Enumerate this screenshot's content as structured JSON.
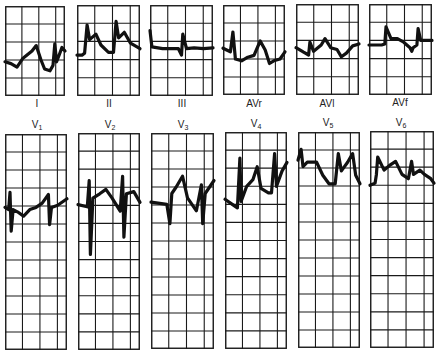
{
  "chart_data": {
    "type": "ecg-12-lead",
    "title": "",
    "layout": {
      "rows": 2,
      "columns": 6,
      "grid": true,
      "top_row_grid": {
        "cols": 4,
        "rows": 5
      },
      "bottom_row_grid": {
        "cols": 4,
        "rows": 12
      }
    },
    "leads": [
      {
        "name": "I",
        "row": 0,
        "col": 0,
        "description": "baseline below center; rounded T waves, small R spikes"
      },
      {
        "name": "II",
        "row": 0,
        "col": 1,
        "description": "tall R spikes followed by elevated ST/T humps"
      },
      {
        "name": "III",
        "row": 0,
        "col": 2,
        "description": "near-flat baseline with small spikes"
      },
      {
        "name": "AVr",
        "row": 0,
        "col": 3,
        "description": "R spikes with deep negative ST segments"
      },
      {
        "name": "AVl",
        "row": 0,
        "col": 4,
        "description": "low amplitude, slight T elevation, negative dips"
      },
      {
        "name": "AVf",
        "row": 0,
        "col": 5,
        "description": "spikes with elevated plateau then return"
      },
      {
        "name": "V1",
        "row": 1,
        "col": 0,
        "description": "rS complexes with deep S waves"
      },
      {
        "name": "V2",
        "row": 1,
        "col": 1,
        "description": "deep S waves, prominent peaked T"
      },
      {
        "name": "V3",
        "row": 1,
        "col": 2,
        "description": "RS complexes, peaked T waves"
      },
      {
        "name": "V4",
        "row": 1,
        "col": 3,
        "description": "tall R, ST elevation with peaked T"
      },
      {
        "name": "V5",
        "row": 1,
        "col": 4,
        "description": "tall R, elevated ST segment, peaked T"
      },
      {
        "name": "V6",
        "row": 1,
        "col": 5,
        "description": "R spikes, elevated ST/T humps"
      }
    ]
  },
  "labels": {
    "top": [
      "I",
      "II",
      "III",
      "AVr",
      "AVl",
      "AVf"
    ],
    "bottom": [
      {
        "base": "V",
        "sub": "1"
      },
      {
        "base": "V",
        "sub": "2"
      },
      {
        "base": "V",
        "sub": "3"
      },
      {
        "base": "V",
        "sub": "4"
      },
      {
        "base": "V",
        "sub": "5"
      },
      {
        "base": "V",
        "sub": "6"
      }
    ]
  },
  "colors": {
    "grid": "#1a1a1a",
    "trace": "#111111",
    "background": "#ffffff"
  }
}
